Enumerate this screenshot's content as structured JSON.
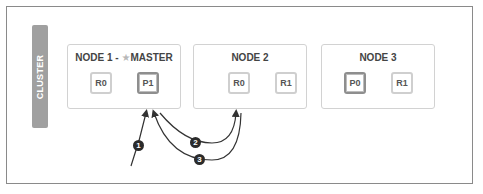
{
  "cluster": {
    "label": "CLUSTER"
  },
  "nodes": [
    {
      "title_prefix": "NODE 1 - ",
      "master_icon": "star-icon",
      "title_suffix": "MASTER",
      "shards": [
        {
          "label": "R0",
          "type": "replica"
        },
        {
          "label": "P1",
          "type": "primary"
        }
      ]
    },
    {
      "title": "NODE 2",
      "shards": [
        {
          "label": "R0",
          "type": "replica"
        },
        {
          "label": "R1",
          "type": "replica"
        }
      ]
    },
    {
      "title": "NODE 3",
      "shards": [
        {
          "label": "P0",
          "type": "primary"
        },
        {
          "label": "R1",
          "type": "replica"
        }
      ]
    }
  ],
  "steps": [
    {
      "number": "1",
      "from": "client",
      "to": "Node 1"
    },
    {
      "number": "2",
      "from": "Node 1",
      "to": "Node 2"
    },
    {
      "number": "3",
      "from": "Node 2",
      "to": "Node 1"
    }
  ],
  "colors": {
    "frame": "#8a8a8a",
    "cluster_bar": "#a0a0a0",
    "node_border": "#d2d2d2",
    "primary_border": "#8e8e8e",
    "replica_border": "#cfcfcf",
    "badge": "#2b2b2b"
  }
}
